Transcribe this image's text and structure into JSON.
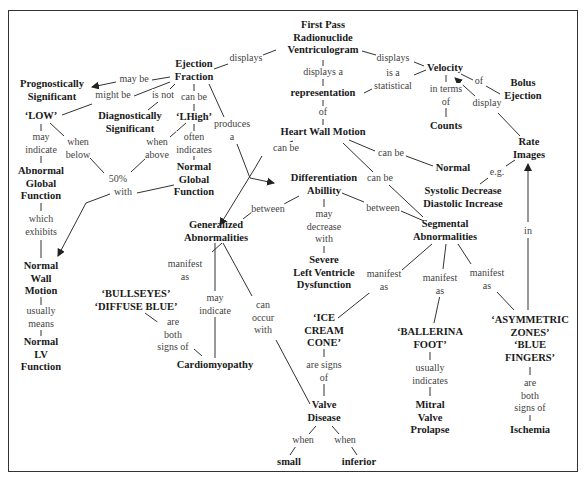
{
  "diagram": {
    "type": "concept-map",
    "nodes": {
      "fprv": "First Pass\nRadionuclide\nVentriculogram",
      "ejection_fraction": "Ejection\nFraction",
      "prognostically_significant": "Prognostically\nSignificant",
      "low": "‘LOW’",
      "diagnostically_significant": "Diagnostically\nSignificant",
      "lhigh": "‘LHigh’",
      "abnormal_global_function": "Abnormal\nGlobal\nFunction",
      "fifty_percent": "50%",
      "normal_global_function": "Normal\nGlobal\nFunction",
      "normal_wall_motion": "Normal\nWall\nMotion",
      "normal_lv_function": "Normal\nLV\nFunction",
      "representation": "representation",
      "heart_wall_motion": "Heart Wall Motion",
      "velocity": "Velocity",
      "counts": "Counts",
      "bolus_ejection": "Bolus\nEjection",
      "rate_images": "Rate\nImages",
      "normal": "Normal",
      "systolic_diastolic": "Systolic Decrease\nDiastolic Increase",
      "differentiation_ability": "Differentiation\nAbillity",
      "generalized_abnormalities": "Generalized\nAbnormalities",
      "segmental_abnormalities": "Segmental\nAbnormalities",
      "severe_lvd": "Severe\nLeft Ventricle\nDysfunction",
      "bullseyes": "‘BULLSEYES’\n‘DIFFUSE BLUE’",
      "cardiomyopathy": "Cardiomyopathy",
      "ice_cream_cone": "‘ICE\nCREAM\nCONE’",
      "ballerina_foot": "‘BALLERINA\nFOOT’",
      "asymmetric_zones": "‘ASYMMETRIC\nZONES’\n‘BLUE\nFINGERS’",
      "valve_disease": "Valve\nDisease",
      "small": "small",
      "inferior": "inferior",
      "mitral_valve_prolapse": "Mitral\nValve\nProlapse",
      "ischemia": "Ischemia"
    },
    "links": {
      "fprv_displays_ef": "displays",
      "fprv_displays_velocity": "displays",
      "fprv_displays_a": "displays a",
      "is_a_statistical": "is a\nstatistical",
      "of_hwm": "of",
      "ef_may_be": "may be",
      "ef_might_be": "might be",
      "ef_is_not": "is not",
      "ef_can_be": "can be",
      "ef_produces_a": "produces\na",
      "low_may_indicate": "may\nindicate",
      "low_when_below": "when\nbelow",
      "lhigh_when_above": "when\nabove",
      "lhigh_often_indicates": "often\nindicates",
      "with": "with",
      "which_exhibits": "which\nexhibits",
      "usually_means": "usually\nmeans",
      "in_terms_of": "in terms\nof",
      "of_bolus": "of",
      "display": "display",
      "eg": "e.g.",
      "in": "in",
      "hwm_can_be_left": "can be",
      "hwm_can_be_normal": "can be",
      "hwm_can_be_seg": "can be",
      "between_left": "between",
      "between_right": "between",
      "may_decrease_with": "may\ndecrease\nwith",
      "gen_manifest_as": "manifest\nas",
      "gen_may_indicate": "may\nindicate",
      "gen_can_occur_with": "can\noccur\nwith",
      "are_both_signs_of_1": "are\nboth\nsigns of",
      "seg_manifest_as_1": "manifest\nas",
      "seg_manifest_as_2": "manifest\nas",
      "seg_manifest_as_3": "manifest\nas",
      "are_signs_of": "are signs\nof",
      "usually_indicates": "usually\nindicates",
      "are_both_signs_of_2": "are\nboth\nsigns of",
      "when_small": "when",
      "when_inferior": "when"
    },
    "colors": {
      "node_text": "#1a1a1a",
      "link_text": "#444444",
      "line": "#333333",
      "border": "#333333"
    }
  }
}
